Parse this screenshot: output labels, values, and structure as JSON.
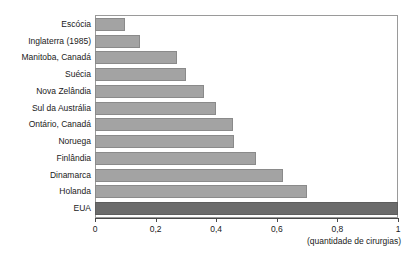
{
  "chart_data": {
    "type": "bar",
    "orientation": "horizontal",
    "title": "",
    "xlabel": "(quantidade de cirurgias)",
    "ylabel": "",
    "xlim": [
      0,
      1
    ],
    "grid": false,
    "legend": null,
    "categories": [
      "Escócia",
      "Inglaterra (1985)",
      "Manitoba, Canadá",
      "Suécia",
      "Nova Zelândia",
      "Sul da Austrália",
      "Ontário, Canadá",
      "Noruega",
      "Finlândia",
      "Dinamarca",
      "Holanda",
      "EUA"
    ],
    "values": [
      0.1,
      0.15,
      0.27,
      0.3,
      0.36,
      0.4,
      0.455,
      0.46,
      0.53,
      0.62,
      0.7,
      1.0
    ],
    "highlight_index": 11,
    "xticks": [
      0,
      0.2,
      0.4,
      0.6,
      0.8,
      1
    ],
    "xtick_labels": [
      "0",
      "0,2",
      "0,4",
      "0,6",
      "0,8",
      "1"
    ],
    "colors": {
      "bar": "#a3a3a3",
      "bar_border": "#8a8a8a",
      "highlight_bar": "#6b6b6b",
      "highlight_border": "#5d5d5d",
      "frame": "#9a9a9a",
      "axis": "#4a4a4a",
      "text": "#1a1a1a",
      "background": "#ffffff"
    }
  }
}
